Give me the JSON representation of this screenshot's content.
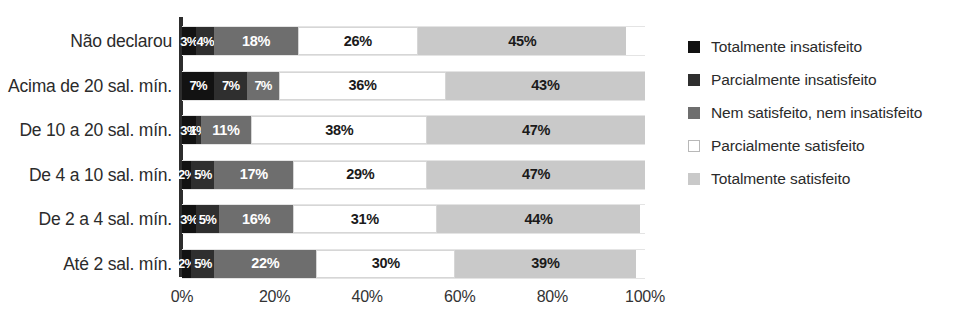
{
  "chart_data": {
    "type": "bar",
    "orientation": "horizontal",
    "stacked": true,
    "normalized_percent": true,
    "title": "",
    "xlabel": "",
    "ylabel": "",
    "xlim": [
      0,
      100
    ],
    "grid": true,
    "legend_position": "right",
    "categories": [
      "Não declarou",
      "Acima de 20 sal. mín.",
      "De 10 a 20 sal. mín.",
      "De 4 a 10 sal. mín.",
      "De 2 a 4 sal. mín.",
      "Até 2 sal. mín."
    ],
    "tick_labels": [
      "0%",
      "20%",
      "40%",
      "60%",
      "80%",
      "100%"
    ],
    "tick_values": [
      0,
      20,
      40,
      60,
      80,
      100
    ],
    "series": [
      {
        "name": "Totalmente insatisfeito",
        "color": "#121212",
        "values": [
          3,
          7,
          3,
          2,
          3,
          2
        ],
        "labels": [
          "3%",
          "7%",
          "3%",
          "2%",
          "3%",
          "2%"
        ]
      },
      {
        "name": "Parcialmente insatisfeito",
        "color": "#2f2f2f",
        "values": [
          4,
          7,
          1,
          5,
          5,
          5
        ],
        "labels": [
          "4%",
          "7%",
          "1%",
          "5%",
          "5%",
          "5%"
        ]
      },
      {
        "name": "Nem satisfeito, nem insatisfeito",
        "color": "#6e6e6e",
        "values": [
          18,
          7,
          11,
          17,
          16,
          22
        ],
        "labels": [
          "18%",
          "7%",
          "11%",
          "17%",
          "16%",
          "22%"
        ]
      },
      {
        "name": "Parcialmente satisfeito",
        "color": "#ffffff",
        "values": [
          26,
          36,
          38,
          29,
          31,
          30
        ],
        "labels": [
          "26%",
          "36%",
          "38%",
          "29%",
          "31%",
          "30%"
        ]
      },
      {
        "name": "Totalmente satisfeito",
        "color": "#c9c9c9",
        "values": [
          45,
          43,
          47,
          47,
          44,
          39
        ],
        "labels": [
          "45%",
          "43%",
          "47%",
          "47%",
          "44%",
          "39%"
        ]
      }
    ]
  },
  "legend": {
    "items": [
      {
        "label": "Totalmente insatisfeito",
        "color": "#121212"
      },
      {
        "label": "Parcialmente insatisfeito",
        "color": "#2f2f2f"
      },
      {
        "label": "Nem satisfeito, nem insatisfeito",
        "color": "#6e6e6e"
      },
      {
        "label": "Parcialmente satisfeito",
        "color": "#ffffff"
      },
      {
        "label": "Totalmente satisfeito",
        "color": "#c9c9c9"
      }
    ]
  }
}
